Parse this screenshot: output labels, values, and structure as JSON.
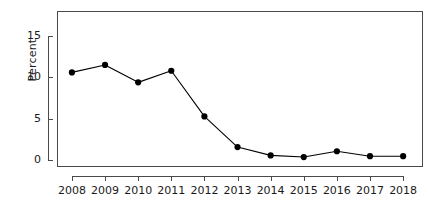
{
  "chart_data": {
    "type": "line",
    "title": "",
    "subtitle": "",
    "xlabel": "",
    "ylabel": "Percent",
    "categories": [
      "2008",
      "2009",
      "2010",
      "2011",
      "2012",
      "2013",
      "2014",
      "2015",
      "2016",
      "2017",
      "2018"
    ],
    "x": [
      2008,
      2009,
      2010,
      2011,
      2012,
      2013,
      2014,
      2015,
      2016,
      2017,
      2018
    ],
    "values": [
      10.6,
      11.5,
      9.4,
      10.8,
      5.3,
      1.6,
      0.6,
      0.4,
      1.1,
      0.5,
      0.5
    ],
    "series": [
      {
        "name": "Percent",
        "values": [
          10.6,
          11.5,
          9.4,
          10.8,
          5.3,
          1.6,
          0.6,
          0.4,
          1.1,
          0.5,
          0.5
        ]
      }
    ],
    "ylim": [
      -0.8,
      18.0
    ],
    "xlim": [
      2007.55,
      2018.6
    ],
    "yticks": [
      0,
      5,
      10,
      15
    ],
    "ytick_labels": [
      "0",
      "5",
      "10",
      "15"
    ],
    "xtick_labels": [
      "2008",
      "2009",
      "2010",
      "2011",
      "2012",
      "2013",
      "2014",
      "2015",
      "2016",
      "2017",
      "2018"
    ],
    "grid": false,
    "legend": false,
    "legend_position": "none",
    "marker": "filled-circle",
    "line_color": "#000000",
    "marker_color": "#000000",
    "axis_color": "#4a4a4a",
    "background_color": "#ffffff",
    "annotations": []
  }
}
